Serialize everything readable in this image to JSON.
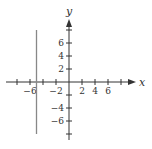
{
  "chart_data": {
    "type": "line",
    "title": "",
    "xlabel": "x",
    "ylabel": "y",
    "xlim": [
      -10,
      10
    ],
    "ylim": [
      -8,
      9
    ],
    "grid": false,
    "x_ticks": [
      -8,
      -6,
      -4,
      -2,
      2,
      4,
      6,
      8
    ],
    "x_tick_labels": [
      {
        "value": -6,
        "text": "−6"
      },
      {
        "value": -2,
        "text": "−2"
      },
      {
        "value": 2,
        "text": "2"
      },
      {
        "value": 4,
        "text": "4"
      },
      {
        "value": 6,
        "text": "6"
      }
    ],
    "y_ticks": [
      -8,
      -6,
      -4,
      -2,
      2,
      4,
      6,
      8
    ],
    "y_tick_labels": [
      {
        "value": 6,
        "text": "6"
      },
      {
        "value": 4,
        "text": "4"
      },
      {
        "value": 2,
        "text": "2"
      },
      {
        "value": -4,
        "text": "−4"
      },
      {
        "value": -6,
        "text": "−6"
      }
    ],
    "series": [
      {
        "name": "x = -5",
        "x": [
          -5,
          -5
        ],
        "y": [
          8,
          -8
        ]
      }
    ]
  },
  "colors": {
    "axis": "#333333",
    "line": "#888888"
  }
}
